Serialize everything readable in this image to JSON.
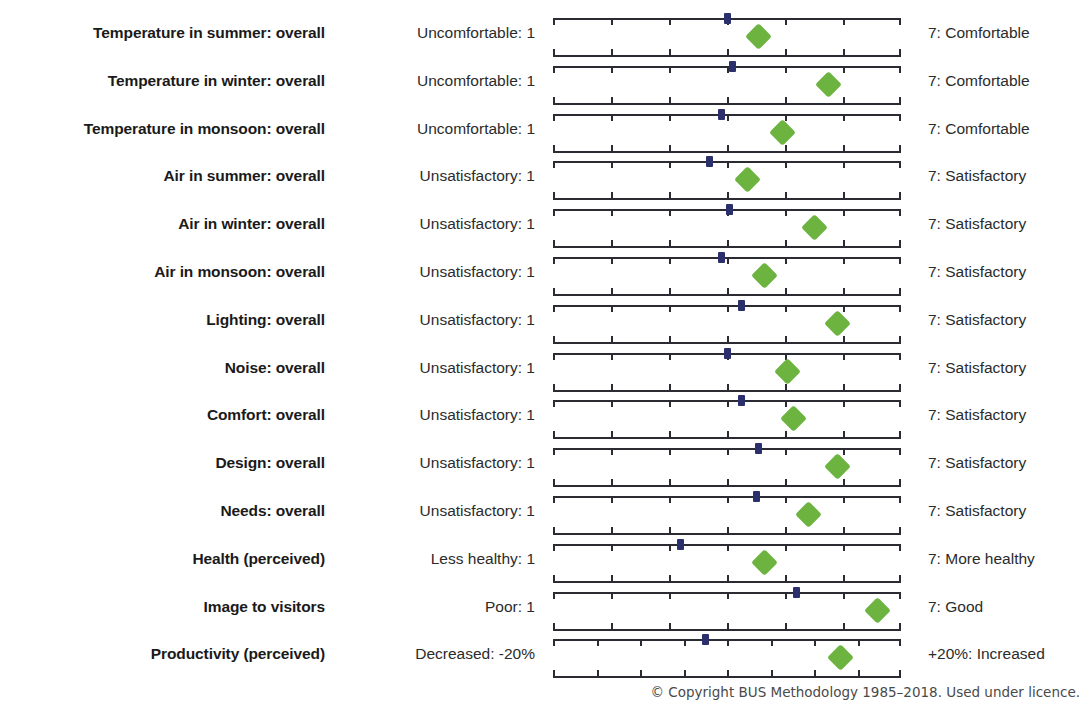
{
  "footer": {
    "copyright": "© Copyright BUS Methodology 1985–2018. Used under licence."
  },
  "colors": {
    "benchmark_marker": "#2b2f6b",
    "score_marker": "#6cb33f",
    "axis": "#2b2f6b",
    "text": "#231f20",
    "background": "#ffffff"
  },
  "chart_data": {
    "type": "scatter",
    "title": "",
    "xlabel": "",
    "ylabel": "",
    "grid": false,
    "legend_position": "none",
    "scale_default": {
      "min": 1,
      "max": 7,
      "ticks": [
        1,
        2,
        3,
        4,
        5,
        6,
        7
      ]
    },
    "series": [
      {
        "name": "Benchmark (mean)",
        "marker": "square",
        "color": "#2b2f6b"
      },
      {
        "name": "Score",
        "marker": "diamond",
        "color": "#6cb33f"
      }
    ],
    "categories": [
      "Temperature in summer: overall",
      "Temperature in winter: overall",
      "Temperature in monsoon: overall",
      "Air in summer: overall",
      "Air in winter: overall",
      "Air in monsoon: overall",
      "Lighting: overall",
      "Noise: overall",
      "Comfort: overall",
      "Design: overall",
      "Needs: overall",
      "Health (perceived)",
      "Image to visitors",
      "Productivity (perceived)"
    ],
    "rows": [
      {
        "label": "Temperature in summer: overall",
        "anchor_low": "Uncomfortable: 1",
        "anchor_high": "7: Comfortable",
        "scale_min": 1,
        "scale_max": 7,
        "tick_count": 7,
        "benchmark": 4.0,
        "score": 4.55
      },
      {
        "label": "Temperature in winter: overall",
        "anchor_low": "Uncomfortable: 1",
        "anchor_high": "7: Comfortable",
        "scale_min": 1,
        "scale_max": 7,
        "tick_count": 7,
        "benchmark": 4.1,
        "score": 5.75
      },
      {
        "label": "Temperature in monsoon: overall",
        "anchor_low": "Uncomfortable: 1",
        "anchor_high": "7: Comfortable",
        "scale_min": 1,
        "scale_max": 7,
        "tick_count": 7,
        "benchmark": 3.9,
        "score": 4.95
      },
      {
        "label": "Air in summer: overall",
        "anchor_low": "Unsatisfactory: 1",
        "anchor_high": "7: Satisfactory",
        "scale_min": 1,
        "scale_max": 7,
        "tick_count": 7,
        "benchmark": 3.7,
        "score": 4.35
      },
      {
        "label": "Air in winter: overall",
        "anchor_low": "Unsatisfactory: 1",
        "anchor_high": "7: Satisfactory",
        "scale_min": 1,
        "scale_max": 7,
        "tick_count": 7,
        "benchmark": 4.05,
        "score": 5.5
      },
      {
        "label": "Air in monsoon: overall",
        "anchor_low": "Unsatisfactory: 1",
        "anchor_high": "7: Satisfactory",
        "scale_min": 1,
        "scale_max": 7,
        "tick_count": 7,
        "benchmark": 3.9,
        "score": 4.65
      },
      {
        "label": "Lighting: overall",
        "anchor_low": "Unsatisfactory: 1",
        "anchor_high": "7: Satisfactory",
        "scale_min": 1,
        "scale_max": 7,
        "tick_count": 7,
        "benchmark": 4.25,
        "score": 5.9
      },
      {
        "label": "Noise: overall",
        "anchor_low": "Unsatisfactory: 1",
        "anchor_high": "7: Satisfactory",
        "scale_min": 1,
        "scale_max": 7,
        "tick_count": 7,
        "benchmark": 4.0,
        "score": 5.05
      },
      {
        "label": "Comfort: overall",
        "anchor_low": "Unsatisfactory: 1",
        "anchor_high": "7: Satisfactory",
        "scale_min": 1,
        "scale_max": 7,
        "tick_count": 7,
        "benchmark": 4.25,
        "score": 5.15
      },
      {
        "label": "Design: overall",
        "anchor_low": "Unsatisfactory: 1",
        "anchor_high": "7: Satisfactory",
        "scale_min": 1,
        "scale_max": 7,
        "tick_count": 7,
        "benchmark": 4.55,
        "score": 5.9
      },
      {
        "label": "Needs: overall",
        "anchor_low": "Unsatisfactory: 1",
        "anchor_high": "7: Satisfactory",
        "scale_min": 1,
        "scale_max": 7,
        "tick_count": 7,
        "benchmark": 4.5,
        "score": 5.4
      },
      {
        "label": "Health (perceived)",
        "anchor_low": "Less healthy: 1",
        "anchor_high": "7: More healthy",
        "scale_min": 1,
        "scale_max": 7,
        "tick_count": 7,
        "benchmark": 3.2,
        "score": 4.65
      },
      {
        "label": "Image to visitors",
        "anchor_low": "Poor: 1",
        "anchor_high": "7: Good",
        "scale_min": 1,
        "scale_max": 7,
        "tick_count": 7,
        "benchmark": 5.2,
        "score": 6.6
      },
      {
        "label": "Productivity (perceived)",
        "anchor_low": "Decreased: -20%",
        "anchor_high": "+20%: Increased",
        "scale_min": -20,
        "scale_max": 20,
        "tick_count": 9,
        "benchmark": -2.5,
        "score": 13.0
      }
    ]
  }
}
